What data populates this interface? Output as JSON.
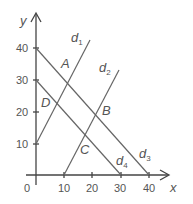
{
  "diagram": {
    "axes": {
      "x_label": "x",
      "y_label": "y",
      "origin_label": "0",
      "x_ticks": [
        "10",
        "20",
        "30",
        "40"
      ],
      "y_ticks": [
        "10",
        "20",
        "30",
        "40"
      ]
    },
    "lines": [
      {
        "name": "d",
        "sub": "1",
        "desc": "through (0,10), slope up"
      },
      {
        "name": "d",
        "sub": "2",
        "desc": "through (10,0), slope up"
      },
      {
        "name": "d",
        "sub": "3",
        "desc": "through (0,40) and (40,0)"
      },
      {
        "name": "d",
        "sub": "4",
        "desc": "through (0,30) and (30,0)"
      }
    ],
    "points": {
      "A": "A",
      "B": "B",
      "C": "C",
      "D": "D"
    },
    "colors": {
      "line": "#666666",
      "axis": "#444444",
      "text": "#555555"
    }
  }
}
